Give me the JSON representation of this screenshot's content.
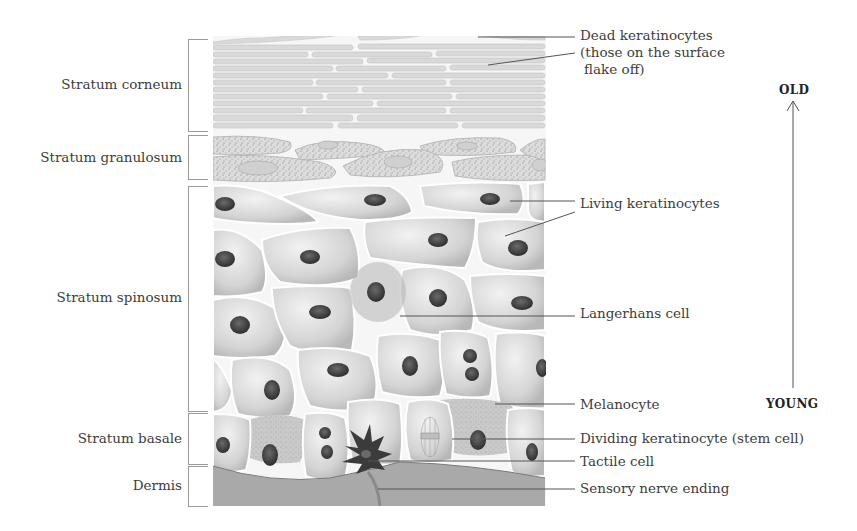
{
  "diagram": {
    "layers": [
      {
        "label": "Stratum corneum",
        "top": 40,
        "bottom": 131
      },
      {
        "label": "Stratum granulosum",
        "top": 135,
        "bottom": 180
      },
      {
        "label": "Stratum spinosum",
        "top": 186,
        "bottom": 411
      },
      {
        "label": "Stratum basale",
        "top": 414,
        "bottom": 464
      },
      {
        "label": "Dermis",
        "top": 467,
        "bottom": 506
      }
    ],
    "annotations": [
      {
        "id": "dead-keratinocytes",
        "lines": [
          "Dead keratinocytes",
          "(those on the surface",
          " flake off)"
        ]
      },
      {
        "id": "living-keratinocytes",
        "lines": [
          "Living keratinocytes"
        ]
      },
      {
        "id": "langerhans-cell",
        "lines": [
          "Langerhans cell"
        ]
      },
      {
        "id": "melanocyte",
        "lines": [
          "Melanocyte"
        ]
      },
      {
        "id": "dividing-keratinocyte",
        "lines": [
          "Dividing keratinocyte (stem cell)"
        ]
      },
      {
        "id": "tactile-cell",
        "lines": [
          "Tactile cell"
        ]
      },
      {
        "id": "sensory-nerve-ending",
        "lines": [
          "Sensory nerve ending"
        ]
      }
    ],
    "age_axis": {
      "top_label": "OLD",
      "bottom_label": "YOUNG",
      "direction": "up"
    },
    "colors": {
      "background": "#ffffff",
      "cell_fill": "#d6d6d6",
      "nucleus": "#3a3a3a",
      "dermis": "#a8a8a8",
      "leader_line": "#555555"
    }
  }
}
